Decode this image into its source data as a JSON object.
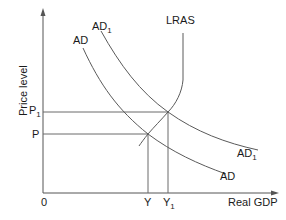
{
  "diagram": {
    "type": "AD-LRAS",
    "axes": {
      "y_label": "Price level",
      "x_label": "Real GDP",
      "origin_label": "0"
    },
    "curves": {
      "lras": {
        "label": "LRAS"
      },
      "ad": {
        "label_main": "AD",
        "label_sub": ""
      },
      "ad1": {
        "label_main": "AD",
        "label_sub": "1"
      }
    },
    "price_levels": {
      "p": {
        "main": "P",
        "sub": ""
      },
      "p1": {
        "main": "P",
        "sub": "1"
      }
    },
    "output_levels": {
      "y": {
        "main": "Y",
        "sub": ""
      },
      "y1": {
        "main": "Y",
        "sub": "1"
      }
    },
    "colors": {
      "line": "#5a5a5a",
      "text": "#1a1a1a",
      "background": "#ffffff"
    }
  }
}
